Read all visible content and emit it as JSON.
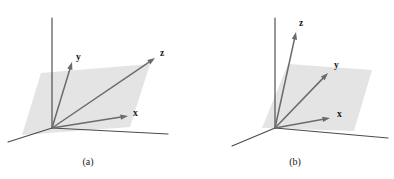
{
  "figure": {
    "background_color": "#ffffff",
    "panels": [
      {
        "id": "panel-a",
        "caption": "(a)",
        "caption_pos": {
          "x": 88,
          "y": 165
        },
        "origin": {
          "x": 52,
          "y": 128
        },
        "plane": {
          "fill_color": "#e3e3e3",
          "points": "41,73 150,64 130,127 22,135"
        },
        "frame_lines": [
          {
            "name": "vertical-axis-line",
            "x1": 52,
            "y1": 128,
            "x2": 52,
            "y2": 18
          },
          {
            "name": "ground-line-left",
            "x1": 52,
            "y1": 128,
            "x2": 8,
            "y2": 142
          },
          {
            "name": "ground-line-right",
            "x1": 52,
            "y1": 128,
            "x2": 168,
            "y2": 134
          }
        ],
        "vectors": [
          {
            "name": "y",
            "label": "y",
            "x1": 52,
            "y1": 128,
            "x2": 72,
            "y2": 62,
            "label_pos": {
              "x": 76,
              "y": 60
            }
          },
          {
            "name": "z",
            "label": "z",
            "x1": 52,
            "y1": 128,
            "x2": 155,
            "y2": 58,
            "label_pos": {
              "x": 160,
              "y": 56
            }
          },
          {
            "name": "x",
            "label": "x",
            "x1": 52,
            "y1": 128,
            "x2": 128,
            "y2": 116,
            "label_pos": {
              "x": 133,
              "y": 116
            }
          }
        ]
      },
      {
        "id": "panel-b",
        "caption": "(b)",
        "caption_pos": {
          "x": 295,
          "y": 165
        },
        "origin": {
          "x": 275,
          "y": 128
        },
        "plane": {
          "fill_color": "#e3e3e3",
          "points": "288,64 372,70 354,131 262,128"
        },
        "frame_lines": [
          {
            "name": "vertical-axis-line",
            "x1": 275,
            "y1": 128,
            "x2": 275,
            "y2": 18
          },
          {
            "name": "ground-line-left",
            "x1": 275,
            "y1": 128,
            "x2": 232,
            "y2": 146
          },
          {
            "name": "ground-line-right",
            "x1": 275,
            "y1": 128,
            "x2": 388,
            "y2": 138
          }
        ],
        "vectors": [
          {
            "name": "z",
            "label": "z",
            "x1": 275,
            "y1": 128,
            "x2": 296,
            "y2": 32,
            "label_pos": {
              "x": 299,
              "y": 26
            }
          },
          {
            "name": "y",
            "label": "y",
            "x1": 275,
            "y1": 128,
            "x2": 328,
            "y2": 73,
            "label_pos": {
              "x": 334,
              "y": 68
            }
          },
          {
            "name": "x",
            "label": "x",
            "x1": 275,
            "y1": 128,
            "x2": 330,
            "y2": 118,
            "label_pos": {
              "x": 337,
              "y": 117
            }
          }
        ]
      }
    ],
    "colors": {
      "plane": "#e3e3e3",
      "frame_line": "#4a4a4a",
      "vector": "#6b6b6b",
      "label_text": "#1a1a1a"
    }
  }
}
